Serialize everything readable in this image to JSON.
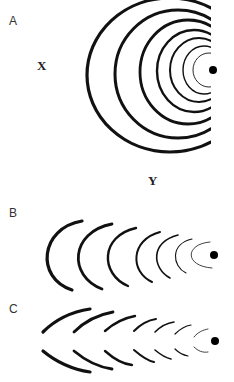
{
  "panels": [
    {
      "label": "A",
      "description": "Concentric arcs (full half-circles) converging on a source dot, clipped at right edge"
    },
    {
      "label": "B",
      "description": "Nested C-shaped arcs converging on a dot"
    },
    {
      "label": "C",
      "description": "Broken arc pairs (upper and lower segments) converging on a dot"
    }
  ],
  "axis_labels": {
    "x": "X",
    "y": "Y"
  },
  "colors": {
    "stroke": "#111111",
    "dot": "#000000",
    "background": "#ffffff"
  }
}
